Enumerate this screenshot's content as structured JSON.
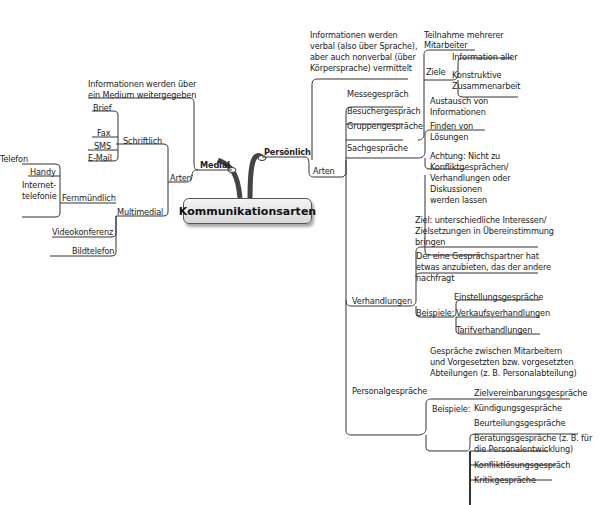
{
  "central": "Kommunikationsarten",
  "medial": {
    "label": "Medial",
    "description": [
      "Informationen werden über",
      "ein Medium weitergegeben"
    ],
    "arten": {
      "label": "Arten",
      "schriftlich": {
        "label": "Schriftlich",
        "items": [
          "Brief",
          "Fax",
          "SMS",
          "E-Mail"
        ]
      },
      "multimedial": {
        "label": "Multimedial",
        "fernmuendlich": {
          "label": "Fernmündlich",
          "items": [
            "Telefon",
            "Handy",
            "Internet-",
            "telefonie"
          ]
        },
        "items": [
          "Videokonferenz",
          "Bildtelefon"
        ]
      }
    }
  },
  "persoenlich": {
    "label": "Persönlich",
    "description": [
      "Informationen werden",
      "verbal (also über Sprache),",
      "aber auch nonverbal (über",
      "Körpersprache) vermittelt"
    ],
    "arten": {
      "label": "Arten",
      "messe": "Messegespräch",
      "besucher": "Besuchergespräch",
      "gruppen": {
        "label": "Gruppengespräche",
        "teilnahme": [
          "Teilnahme mehrerer",
          "Mitarbeiter"
        ],
        "ziele": {
          "label": "Ziele",
          "items": [
            "Information aller",
            "Konstruktive",
            "Zusammenarbeit"
          ]
        }
      },
      "sach": {
        "label": "Sachgespräche",
        "items": [
          "Austausch von",
          "Informationen",
          "Finden von",
          "Lösungen"
        ],
        "achtung": [
          "Achtung: Nicht zu",
          "Konfliktgesprächen/",
          "Verhandlungen oder",
          "Diskussionen",
          "werden lassen"
        ]
      },
      "verhandlungen": {
        "label": "Verhandlungen",
        "ziel": [
          "Ziel: unterschiedliche Interessen/",
          "Zielsetzungen in Übereinstimmung",
          "bringen"
        ],
        "partner": [
          "Der eine Gesprächspartner hat",
          "etwas anzubieten, das der andere",
          "nachfragt"
        ],
        "beispiele": {
          "label": "Beispiele:",
          "items": [
            "Einstellungsgespräche",
            "Verkaufsverhandlungen",
            "Tarifverhandlungen"
          ]
        }
      },
      "personal": {
        "label": "Personalgespräche",
        "description": [
          "Gespräche zwischen Mitarbeitern",
          "und Vorgesetzten bzw. vorgesetzten",
          "Abteilungen (z. B. Personalabteilung)"
        ],
        "beispiele": {
          "label": "Beispiele:",
          "items": [
            "Zielvereinbarungsgespräche",
            "Kündigungsgespräche",
            "Beurteilungsgespräche",
            "Beratungsgespräche (z. B. für",
            "die Personalentwicklung)",
            "Konfliktlösungsgespräch",
            "Kritikgespräche"
          ]
        }
      }
    }
  }
}
